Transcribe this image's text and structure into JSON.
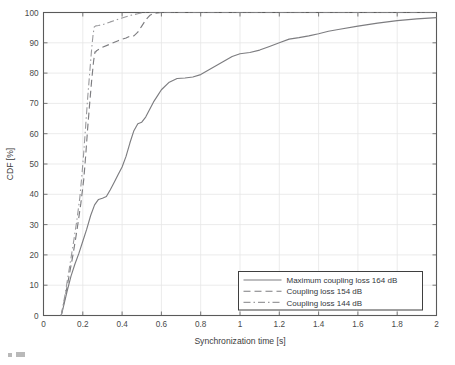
{
  "figure": {
    "background_color": "#ffffff",
    "axes_color": "#5a5a5a",
    "grid_color": "#e6e6e6"
  },
  "axes": {
    "x_title": "Synchronization time [s]",
    "y_title": "CDF [%]",
    "x_ticks": [
      "0",
      "0.2",
      "0.4",
      "0.6",
      "0.8",
      "1",
      "1.2",
      "1.4",
      "1.6",
      "1.8",
      "2"
    ],
    "y_ticks": [
      "0",
      "10",
      "20",
      "30",
      "40",
      "50",
      "60",
      "70",
      "80",
      "90",
      "100"
    ]
  },
  "legend": {
    "entries": [
      {
        "label": "Maximum coupling loss 164 dB",
        "style": "solid"
      },
      {
        "label": "Coupling loss 154 dB",
        "style": "dashed"
      },
      {
        "label": "Coupling loss 144 dB",
        "style": "dash-dot"
      }
    ]
  },
  "chart_data": {
    "type": "line",
    "title": "",
    "xlabel": "Synchronization time [s]",
    "ylabel": "CDF [%]",
    "xlim": [
      0,
      2
    ],
    "ylim": [
      0,
      100
    ],
    "xtick_step": 0.2,
    "ytick_step": 10,
    "grid": true,
    "legend_position": "lower right",
    "series": [
      {
        "name": "Maximum coupling loss 164 dB",
        "style": "solid",
        "color": "#7d7d80",
        "x": [
          0.09,
          0.1,
          0.12,
          0.14,
          0.16,
          0.18,
          0.2,
          0.22,
          0.24,
          0.26,
          0.28,
          0.3,
          0.32,
          0.34,
          0.36,
          0.38,
          0.4,
          0.42,
          0.44,
          0.46,
          0.48,
          0.5,
          0.52,
          0.54,
          0.56,
          0.58,
          0.6,
          0.64,
          0.68,
          0.72,
          0.76,
          0.8,
          0.84,
          0.88,
          0.92,
          0.96,
          1.0,
          1.05,
          1.1,
          1.15,
          1.2,
          1.25,
          1.3,
          1.35,
          1.4,
          1.45,
          1.5,
          1.6,
          1.7,
          1.8,
          1.9,
          2.0
        ],
        "y": [
          0.0,
          2.5,
          8.0,
          13.0,
          17.0,
          20.5,
          24.5,
          28.5,
          33.0,
          36.5,
          38.3,
          38.7,
          39.3,
          41.5,
          44.0,
          46.5,
          49.0,
          52.5,
          57.0,
          61.0,
          63.3,
          63.8,
          65.5,
          68.0,
          70.5,
          72.5,
          74.5,
          77.0,
          78.2,
          78.4,
          78.7,
          79.5,
          81.0,
          82.5,
          84.0,
          85.5,
          86.4,
          86.8,
          87.6,
          88.8,
          90.0,
          91.2,
          91.7,
          92.3,
          93.0,
          93.8,
          94.4,
          95.5,
          96.5,
          97.3,
          97.9,
          98.3
        ]
      },
      {
        "name": "Coupling loss 154 dB",
        "style": "dashed",
        "color": "#7d7d80",
        "x": [
          0.09,
          0.11,
          0.13,
          0.15,
          0.17,
          0.19,
          0.205,
          0.215,
          0.225,
          0.235,
          0.245,
          0.255,
          0.262,
          0.266,
          0.27,
          0.3,
          0.34,
          0.38,
          0.42,
          0.44,
          0.46,
          0.48,
          0.5,
          0.52,
          0.54,
          0.56,
          0.6,
          0.7,
          1.0,
          1.5,
          2.0
        ],
        "y": [
          0.0,
          6.0,
          13.0,
          20.0,
          28.0,
          37.0,
          45.0,
          53.0,
          62.0,
          70.0,
          77.5,
          84.0,
          87.0,
          87.0,
          87.4,
          88.5,
          89.6,
          90.7,
          91.6,
          92.2,
          92.3,
          93.5,
          95.5,
          97.5,
          99.0,
          99.7,
          100.0,
          100.0,
          100.0,
          100.0,
          100.0
        ]
      },
      {
        "name": "Coupling loss 144 dB",
        "style": "dash-dot",
        "color": "#9a9a9d",
        "x": [
          0.09,
          0.11,
          0.13,
          0.15,
          0.17,
          0.185,
          0.195,
          0.205,
          0.215,
          0.225,
          0.235,
          0.245,
          0.252,
          0.258,
          0.266,
          0.28,
          0.3,
          0.32,
          0.34,
          0.36,
          0.38,
          0.4,
          0.42,
          0.44,
          0.46,
          0.48,
          0.5,
          0.52,
          0.54,
          0.6,
          0.8,
          1.2,
          1.6,
          2.0
        ],
        "y": [
          0.0,
          7.0,
          15.0,
          23.0,
          31.5,
          39.0,
          46.0,
          54.0,
          63.0,
          72.0,
          80.0,
          88.0,
          92.5,
          95.2,
          95.6,
          95.7,
          96.0,
          96.4,
          96.9,
          97.3,
          97.8,
          98.2,
          98.6,
          99.0,
          99.3,
          99.6,
          99.9,
          100.0,
          100.0,
          100.0,
          100.0,
          100.0,
          100.0,
          100.0
        ]
      }
    ]
  }
}
